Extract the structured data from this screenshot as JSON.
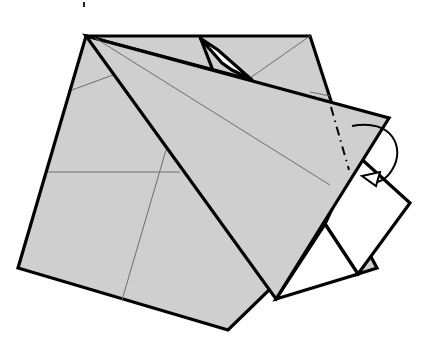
{
  "diagram": {
    "paper_color": "#cfcfcf",
    "line_color": "#000000",
    "crease_color": "#6e6e6e",
    "elements": [
      {
        "name": "back-square",
        "kind": "paper layer (grey)"
      },
      {
        "name": "kite-flap",
        "kind": "folded flap (grey)"
      },
      {
        "name": "white-rectangle",
        "kind": "exposed reverse side (white)"
      },
      {
        "name": "white-triangle",
        "kind": "exposed reverse side (white)"
      },
      {
        "name": "mountain-fold-line",
        "kind": "dash-dot fold line"
      },
      {
        "name": "fold-behind-arrow",
        "kind": "curved arrow indicating fold behind"
      }
    ],
    "instruction": "Mountain fold the tip behind along the dash-dot line"
  }
}
